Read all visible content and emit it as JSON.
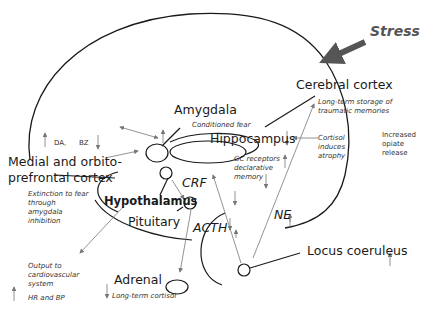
{
  "diagram": {
    "stress_label": "Stress",
    "colors": {
      "outline": "#1a1a1a",
      "arrow": "#777777",
      "stress_arrow": "#555555"
    },
    "regions": {
      "cerebral_cortex": {
        "label": "Cerebral cortex",
        "note": "Long-term storage of traumatic memories"
      },
      "amygdala": {
        "label": "Amygdala",
        "note": "Conditioned fear",
        "change": "up"
      },
      "hippocampus": {
        "label": "Hippocampus",
        "note": "GC receptors declarative memory",
        "change": "down",
        "side_note": "Cortisol induces atrophy"
      },
      "prefrontal": {
        "label_line1": "Medial and orbito-",
        "label_line2": "prefrontal cortex",
        "note": "Extinction to fear through amygdala inhibition"
      },
      "hypothalamus": {
        "label": "Hypothalamus"
      },
      "pituitary": {
        "label": "Pituitary"
      },
      "adrenal": {
        "label": "Adrenal",
        "note": "Long-term cortisol"
      },
      "locus_coeruleus": {
        "label": "Locus coeruleus",
        "change": "up"
      }
    },
    "neurotransmitters": {
      "da": "DA,",
      "bz": "BZ"
    },
    "hormones": {
      "crf": "CRF",
      "acth": "ACTH",
      "ne": "NE"
    },
    "outputs": {
      "opiate": "Increased opiate release",
      "cardio": "Output to cardiovascular system",
      "hr_bp": "HR and BP"
    }
  }
}
